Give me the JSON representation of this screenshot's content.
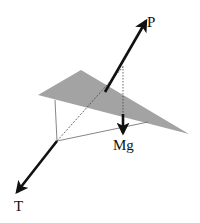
{
  "diagram": {
    "colors": {
      "sail": "#a3a3a3",
      "arrow": "#111111",
      "line": "#555555"
    },
    "forces": [
      {
        "id": "P",
        "label": "P"
      },
      {
        "id": "Mg",
        "label": "Mg"
      },
      {
        "id": "T",
        "label": "T"
      }
    ]
  }
}
